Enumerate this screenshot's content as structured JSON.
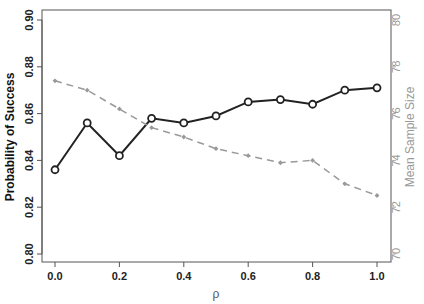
{
  "chart_data": {
    "type": "line",
    "title": "",
    "xlabel": "ρ",
    "ylabel_left": "Probability of Success",
    "ylabel_right": "Mean Sample Size",
    "x": [
      0.0,
      0.1,
      0.2,
      0.3,
      0.4,
      0.5,
      0.6,
      0.7,
      0.8,
      0.9,
      1.0
    ],
    "xlim": [
      0.0,
      1.0
    ],
    "xticks": [
      "0.0",
      "0.2",
      "0.4",
      "0.6",
      "0.8",
      "1.0"
    ],
    "ylim_left": [
      0.8,
      0.9
    ],
    "yticks_left": [
      "0.80",
      "0.82",
      "0.84",
      "0.86",
      "0.88",
      "0.90"
    ],
    "ylim_right": [
      70,
      80
    ],
    "yticks_right": [
      "70",
      "72",
      "74",
      "76",
      "78",
      "80"
    ],
    "grid": false,
    "legend": "none",
    "series": [
      {
        "name": "Probability of Success",
        "axis": "left",
        "style": "solid",
        "marker": "open-circle",
        "color": "#222222",
        "values": [
          0.836,
          0.856,
          0.842,
          0.858,
          0.856,
          0.859,
          0.865,
          0.866,
          0.864,
          0.87,
          0.871
        ]
      },
      {
        "name": "Mean Sample Size",
        "axis": "right",
        "style": "dashed",
        "marker": "small-diamond",
        "color": "#999999",
        "values": [
          77.4,
          77.0,
          76.2,
          75.4,
          75.0,
          74.5,
          74.2,
          73.9,
          74.0,
          73.0,
          72.5
        ]
      }
    ]
  }
}
